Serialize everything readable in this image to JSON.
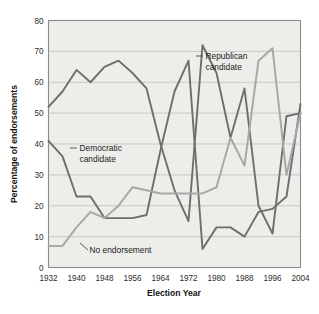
{
  "chart_data": {
    "type": "line",
    "title": "",
    "xlabel": "Election Year",
    "ylabel": "Percentage of endorsements",
    "xlim": [
      1932,
      2004
    ],
    "ylim": [
      0,
      80
    ],
    "grid": true,
    "legend_position": "inline-annotations",
    "x": [
      1932,
      1936,
      1940,
      1944,
      1948,
      1952,
      1956,
      1960,
      1964,
      1968,
      1972,
      1976,
      1980,
      1984,
      1988,
      1992,
      1996,
      2000,
      2004
    ],
    "xticks": [
      "1932",
      "1940",
      "1948",
      "1956",
      "1964",
      "1972",
      "1980",
      "1988",
      "1996",
      "2004"
    ],
    "xtick_values": [
      1932,
      1940,
      1948,
      1956,
      1964,
      1972,
      1980,
      1988,
      1996,
      2004
    ],
    "yticks": [
      "0",
      "10",
      "20",
      "30",
      "40",
      "50",
      "60",
      "70",
      "80"
    ],
    "ytick_values": [
      0,
      10,
      20,
      30,
      40,
      50,
      60,
      70,
      80
    ],
    "series": [
      {
        "name": "Republican candidate",
        "color": "#6e6e6e",
        "values": [
          52,
          57,
          64,
          60,
          65,
          67,
          63,
          58,
          40,
          25,
          15,
          72,
          63,
          42,
          58,
          20,
          11,
          49,
          50
        ]
      },
      {
        "name": "Democratic candidate",
        "color": "#6e6e6e",
        "values": [
          41,
          36,
          23,
          23,
          16,
          16,
          16,
          17,
          38,
          57,
          67,
          6,
          13,
          13,
          10,
          18,
          19,
          23,
          53
        ]
      },
      {
        "name": "No endorsement",
        "color": "#a8a8a8",
        "values": [
          7,
          7,
          13,
          18,
          16,
          20,
          26,
          25,
          24,
          24,
          24,
          24,
          26,
          42,
          33,
          67,
          71,
          30,
          50
        ]
      }
    ],
    "annotations": [
      {
        "text_line1": "Republican",
        "text_line2": "candidate"
      },
      {
        "text_line1": "Democratic",
        "text_line2": "candidate"
      },
      {
        "text_line1": "No endorsement",
        "text_line2": ""
      }
    ]
  },
  "colors": {
    "plot_background": "#ededea",
    "frame": "#8c8c8c",
    "gridline": "#b9b9b9",
    "dark_series": "#6e6e6e",
    "light_series": "#a8a8a8",
    "text": "#141414"
  }
}
